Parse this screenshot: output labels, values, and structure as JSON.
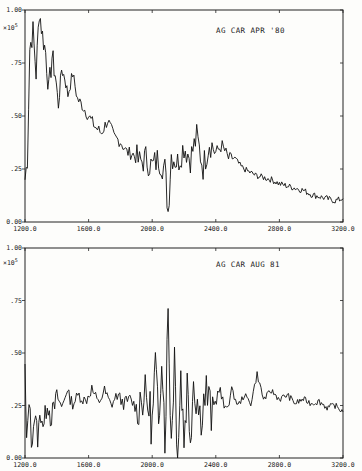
{
  "chart_data": [
    {
      "type": "line",
      "title": "AG CAR APR '80",
      "xlabel": "",
      "ylabel": "",
      "y_multiplier": "×10^5",
      "xlim": [
        1200,
        3200
      ],
      "ylim": [
        0,
        1.0
      ],
      "x_ticks": [
        "1200.0",
        "1600.0",
        "2000.0",
        "2400.0",
        "2800.0",
        "3200.0"
      ],
      "y_ticks": [
        "0.00",
        ".25",
        ".50",
        ".75",
        "1.00"
      ],
      "grid": false,
      "x": [
        1200,
        1215,
        1230,
        1250,
        1270,
        1290,
        1310,
        1330,
        1350,
        1370,
        1390,
        1410,
        1430,
        1450,
        1470,
        1500,
        1530,
        1560,
        1600,
        1640,
        1680,
        1720,
        1760,
        1800,
        1840,
        1880,
        1920,
        1960,
        2000,
        2040,
        2080,
        2100,
        2120,
        2160,
        2200,
        2240,
        2280,
        2320,
        2360,
        2400,
        2440,
        2480,
        2520,
        2560,
        2600,
        2650,
        2700,
        2750,
        2800,
        2850,
        2900,
        2950,
        3000,
        3050,
        3100,
        3150,
        3200
      ],
      "y": [
        0.2,
        0.3,
        0.82,
        0.9,
        0.7,
        1.0,
        0.88,
        0.8,
        0.62,
        0.78,
        0.7,
        0.55,
        0.72,
        0.68,
        0.6,
        0.7,
        0.58,
        0.55,
        0.5,
        0.45,
        0.42,
        0.48,
        0.4,
        0.38,
        0.33,
        0.32,
        0.28,
        0.3,
        0.26,
        0.3,
        0.25,
        0.05,
        0.32,
        0.28,
        0.36,
        0.3,
        0.4,
        0.26,
        0.38,
        0.33,
        0.36,
        0.3,
        0.3,
        0.26,
        0.24,
        0.22,
        0.21,
        0.2,
        0.18,
        0.17,
        0.16,
        0.15,
        0.13,
        0.12,
        0.11,
        0.1,
        0.11
      ]
    },
    {
      "type": "line",
      "title": "AG CAR AUG 81",
      "xlabel": "",
      "ylabel": "",
      "y_multiplier": "×10^5",
      "xlim": [
        1200,
        3200
      ],
      "ylim": [
        0,
        1.0
      ],
      "x_ticks": [
        "1200.0",
        "1600.0",
        "2000.0",
        "2400.0",
        "2800.0",
        "3200.0"
      ],
      "y_ticks": [
        "0.00",
        ".25",
        ".50",
        ".75",
        "1.00"
      ],
      "grid": false,
      "x": [
        1200,
        1210,
        1225,
        1240,
        1260,
        1280,
        1300,
        1320,
        1340,
        1360,
        1380,
        1400,
        1430,
        1460,
        1500,
        1540,
        1580,
        1620,
        1660,
        1700,
        1740,
        1780,
        1820,
        1860,
        1900,
        1940,
        1980,
        2000,
        2020,
        2040,
        2060,
        2080,
        2100,
        2120,
        2140,
        2160,
        2180,
        2200,
        2220,
        2240,
        2260,
        2300,
        2340,
        2380,
        2420,
        2460,
        2500,
        2540,
        2580,
        2620,
        2660,
        2700,
        2750,
        2800,
        2850,
        2900,
        2950,
        3000,
        3050,
        3100,
        3150,
        3200
      ],
      "y": [
        0.42,
        0.05,
        0.3,
        0.08,
        0.2,
        0.1,
        0.22,
        0.15,
        0.28,
        0.2,
        0.22,
        0.3,
        0.24,
        0.32,
        0.26,
        0.3,
        0.27,
        0.33,
        0.26,
        0.32,
        0.25,
        0.3,
        0.26,
        0.28,
        0.24,
        0.3,
        0.25,
        0.15,
        0.45,
        0.12,
        0.55,
        0.1,
        0.7,
        0.08,
        0.5,
        0.0,
        0.4,
        0.1,
        0.35,
        0.12,
        0.38,
        0.2,
        0.32,
        0.18,
        0.34,
        0.22,
        0.32,
        0.25,
        0.3,
        0.26,
        0.4,
        0.28,
        0.32,
        0.28,
        0.3,
        0.26,
        0.28,
        0.26,
        0.27,
        0.24,
        0.25,
        0.22
      ]
    }
  ],
  "panels": {
    "top": {
      "title": "AG CAR APR '80",
      "multiplier_base": "×10",
      "multiplier_exp": "5"
    },
    "bottom": {
      "title": "AG CAR AUG 81",
      "multiplier_base": "×10",
      "multiplier_exp": "5"
    }
  },
  "axis": {
    "x_ticks": [
      "1200.0",
      "1600.0",
      "2000.0",
      "2400.0",
      "2800.0",
      "3200.0"
    ],
    "y_ticks": [
      "0.00",
      ".25",
      ".50",
      ".75",
      "1.00"
    ]
  },
  "colors": {
    "ink": "#111111",
    "paper": "#fdfdfb"
  }
}
